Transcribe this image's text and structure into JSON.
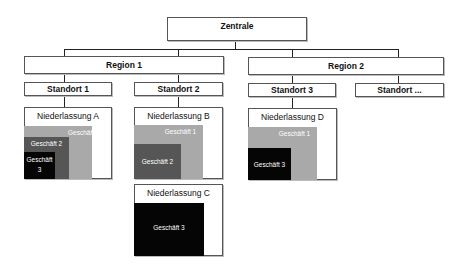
{
  "diagram": {
    "root": {
      "label": "Zentrale"
    },
    "regions": [
      {
        "label": "Region 1"
      },
      {
        "label": "Region 2"
      }
    ],
    "standorte": [
      {
        "label": "Standort 1",
        "region": "Region 1"
      },
      {
        "label": "Standort 2",
        "region": "Region 1"
      },
      {
        "label": "Standort 3",
        "region": "Region 2"
      },
      {
        "label": "Standort ...",
        "region": "Region 2"
      }
    ],
    "niederlassungen": [
      {
        "label": "Niederlassung A",
        "standort": "Standort 1",
        "geschaefte": [
          {
            "label": "Geschäft 1"
          },
          {
            "label": "Geschäft 2"
          },
          {
            "label": "Geschäft 3"
          }
        ]
      },
      {
        "label": "Niederlassung B",
        "standort": "Standort 2",
        "geschaefte": [
          {
            "label": "Geschäft 1"
          },
          {
            "label": "Geschäft 2"
          }
        ]
      },
      {
        "label": "Niederlassung C",
        "standort": "Standort 2",
        "geschaefte": [
          {
            "label": "Geschäft 3"
          }
        ]
      },
      {
        "label": "Niederlassung D",
        "standort": "Standort 3",
        "geschaefte": [
          {
            "label": "Geschäft 1"
          },
          {
            "label": "Geschäft 3"
          }
        ]
      }
    ],
    "colors": {
      "geschaeft_1": "#a9a9a9",
      "geschaeft_2": "#565656",
      "geschaeft_3": "#050505"
    },
    "geschaeft_3_split": {
      "line1": "Geschäft",
      "line2": "3"
    }
  }
}
